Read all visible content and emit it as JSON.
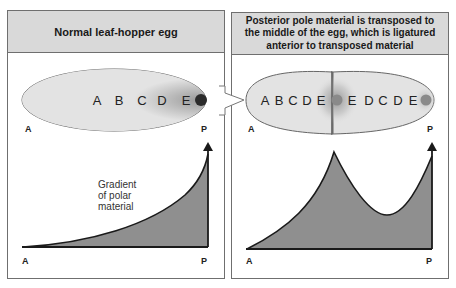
{
  "panels": {
    "left": {
      "title": "Normal leaf-hopper egg",
      "egg_letters": [
        "A",
        "B",
        "C",
        "D",
        "E"
      ],
      "axis_labels": {
        "anterior": "A",
        "posterior": "P"
      },
      "graph_label_lines": [
        "Gradient",
        "of polar",
        "material"
      ]
    },
    "right": {
      "title": "Posterior pole material is transposed to the middle of the egg, which is ligatured anterior to transposed material",
      "egg_letters_anterior": [
        "A",
        "B",
        "C",
        "D",
        "E"
      ],
      "egg_letters_posterior": [
        "E",
        "D",
        "C",
        "D",
        "E"
      ],
      "axis_labels": {
        "anterior": "A",
        "posterior": "P"
      }
    }
  },
  "connector": {
    "icon": "arrow-right-icon"
  },
  "colors": {
    "header_bg": "#d9d9d9",
    "egg_fill": "#e3e3e3",
    "pole_dark": "#2b2b2b",
    "pole_grey": "#8a8a8a",
    "graph_fill": "#8f8f8f",
    "line": "#1a1a1a",
    "border": "#6f6f6f"
  }
}
